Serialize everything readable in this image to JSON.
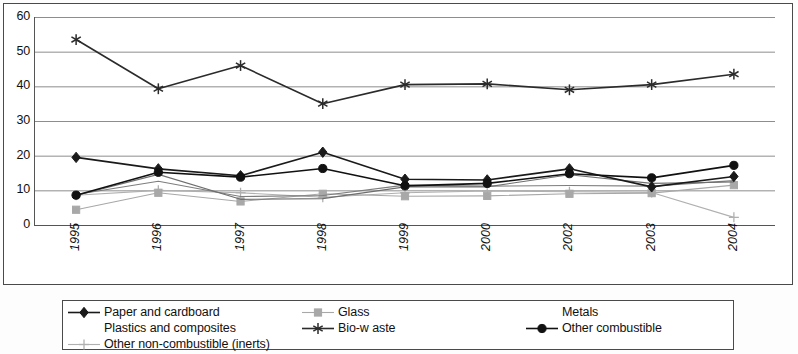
{
  "chart_data": {
    "type": "line",
    "title": "",
    "subtitle": "",
    "xlabel": "",
    "ylabel": "",
    "xlim": [
      0,
      8
    ],
    "ylim": [
      0,
      60
    ],
    "ytick_step": 10,
    "yticks": [
      "60",
      "50",
      "40",
      "30",
      "20",
      "10",
      "0"
    ],
    "grid": "horizontal",
    "legend_position": "bottom",
    "categories": [
      "1995",
      "1996",
      "1997",
      "1998",
      "1999",
      "2000",
      "2002",
      "2003",
      "2004"
    ],
    "series": [
      {
        "name": "Paper and cardboard",
        "marker": "diamond",
        "color": "#1a1a1a",
        "values": [
          19.5,
          16.2,
          14.2,
          21.0,
          13.2,
          13.0,
          16.2,
          11.0,
          14.0
        ]
      },
      {
        "name": "Plastics and composites",
        "marker": "none",
        "color": "#7d7d7d",
        "values": [
          8.8,
          12.6,
          8.2,
          8.5,
          11.5,
          11.2,
          11.4,
          11.2,
          12.8
        ]
      },
      {
        "name": "Other non-combustible (inerts)",
        "marker": "plus",
        "color": "#b0b0b0",
        "values": [
          8.6,
          10.0,
          9.3,
          8.0,
          9.3,
          9.8,
          9.6,
          9.4,
          2.2
        ]
      },
      {
        "name": "Glass",
        "marker": "square",
        "color": "#a8a8a8",
        "values": [
          4.4,
          9.3,
          6.8,
          9.0,
          8.3,
          8.4,
          9.0,
          9.2,
          11.5
        ]
      },
      {
        "name": "Bio-w aste",
        "marker": "asterisk",
        "color": "#2b2b2b",
        "values": [
          53.5,
          39.3,
          46.0,
          35.0,
          40.5,
          40.7,
          39.0,
          40.5,
          43.5
        ]
      },
      {
        "name": "Metals",
        "marker": "none",
        "color": "#6e6e6e",
        "values": [
          8.5,
          14.6,
          7.4,
          7.6,
          11.0,
          11.0,
          14.5,
          12.0,
          12.4
        ]
      },
      {
        "name": "Other combustible",
        "marker": "circle",
        "color": "#111111",
        "values": [
          8.6,
          15.2,
          13.8,
          16.3,
          11.3,
          12.0,
          14.8,
          13.6,
          17.2
        ]
      }
    ]
  },
  "legend": {
    "entries": [
      {
        "label": "Paper and cardboard",
        "marker": "diamond",
        "color": "#1a1a1a",
        "row": 0,
        "col": 0
      },
      {
        "label": "Glass",
        "marker": "square",
        "color": "#a8a8a8",
        "row": 0,
        "col": 1
      },
      {
        "label": "Metals",
        "marker": "none",
        "color": "#6e6e6e",
        "row": 0,
        "col": 2
      },
      {
        "label": "Plastics and composites",
        "marker": "none",
        "color": "#7d7d7d",
        "row": 1,
        "col": 0
      },
      {
        "label": "Bio-w aste",
        "marker": "asterisk",
        "color": "#2b2b2b",
        "row": 1,
        "col": 1
      },
      {
        "label": "Other combustible",
        "marker": "circle",
        "color": "#111111",
        "row": 1,
        "col": 2
      },
      {
        "label": "Other non-combustible (inerts)",
        "marker": "plus",
        "color": "#b0b0b0",
        "row": 2,
        "col": 0
      }
    ]
  }
}
